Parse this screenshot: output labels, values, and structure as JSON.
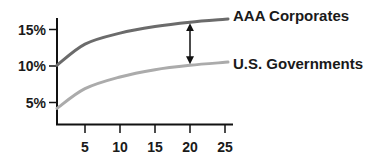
{
  "chart_data": {
    "type": "line",
    "title": "",
    "xlabel": "",
    "ylabel": "",
    "x": [
      1,
      5,
      10,
      15,
      20,
      25
    ],
    "series": [
      {
        "name": "AAA Corporates",
        "color": "#6b6b6b",
        "values": [
          10.1,
          13.0,
          14.5,
          15.4,
          16.0,
          16.4
        ]
      },
      {
        "name": "U.S. Governments",
        "color": "#ababab",
        "values": [
          4.2,
          6.9,
          8.5,
          9.5,
          10.1,
          10.5
        ]
      }
    ],
    "xticks": [
      5,
      10,
      15,
      20,
      25
    ],
    "xtick_labels": [
      "5",
      "10",
      "15",
      "20",
      "25"
    ],
    "yticks": [
      5,
      10,
      15
    ],
    "ytick_labels": [
      "5%",
      "10%",
      "15%"
    ],
    "xlim": [
      1,
      28
    ],
    "ylim": [
      2,
      17
    ],
    "grid": false,
    "legend_position": "inline-right",
    "annotations": [
      {
        "type": "double-arrow",
        "x": 20,
        "from": "U.S. Governments",
        "to": "AAA Corporates",
        "meaning": "yield spread"
      }
    ]
  }
}
